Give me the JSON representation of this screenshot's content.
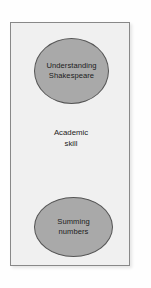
{
  "diagram": {
    "container": {
      "name": "Academic skill container",
      "fill_color": "#f0f0f0",
      "border_color": "#888888"
    },
    "center_label": {
      "line1": "Academic",
      "line2": "skill"
    },
    "nodes": [
      {
        "id": "understanding-shakespeare",
        "shape": "ellipse",
        "line1": "Understanding",
        "line2": "Shakespeare",
        "fill_color": "#a9a9a9",
        "border_color": "#555555",
        "position": "top"
      },
      {
        "id": "summing-numbers",
        "shape": "ellipse",
        "line1": "Summing",
        "line2": "numbers",
        "fill_color": "#a9a9a9",
        "border_color": "#555555",
        "position": "bottom"
      }
    ]
  }
}
